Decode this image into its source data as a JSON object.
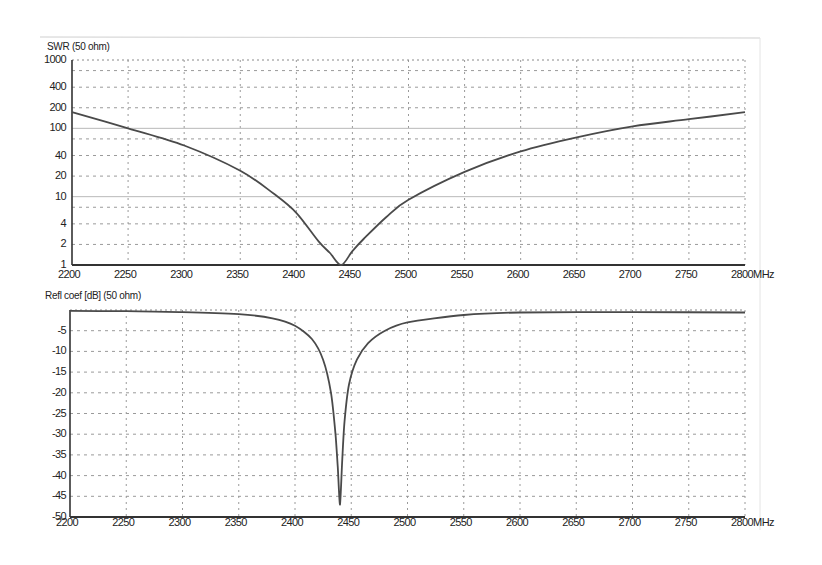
{
  "chart_data": [
    {
      "type": "line",
      "title": "SWR (50 ohm)",
      "xlabel": "MHz",
      "ylabel": "SWR",
      "yscale": "log",
      "xlim": [
        2200,
        2800
      ],
      "ylim": [
        1,
        1000
      ],
      "grid": true,
      "x_ticks": [
        "2200",
        "2250",
        "2300",
        "2350",
        "2400",
        "2450",
        "2500",
        "2550",
        "2600",
        "2650",
        "2700",
        "2750",
        "2800MHz"
      ],
      "y_ticks": [
        "1000",
        "400",
        "200",
        "100",
        "40",
        "20",
        "10",
        "4",
        "2",
        "1"
      ],
      "y_tick_values": [
        1000,
        400,
        200,
        100,
        40,
        20,
        10,
        4,
        2,
        1
      ],
      "series": [
        {
          "name": "SWR",
          "x": [
            2200,
            2250,
            2300,
            2350,
            2380,
            2400,
            2420,
            2430,
            2440,
            2450,
            2460,
            2480,
            2500,
            2550,
            2600,
            2650,
            2700,
            2750,
            2800
          ],
          "values": [
            172,
            100,
            56,
            24,
            11,
            5.8,
            2.2,
            1.5,
            1.0,
            1.6,
            2.4,
            5,
            9,
            23,
            46,
            74,
            107,
            136,
            172
          ]
        }
      ]
    },
    {
      "type": "line",
      "title": "Refl coef [dB] (50 ohm)",
      "xlabel": "MHz",
      "ylabel": "Reflection coefficient (dB)",
      "xlim": [
        2200,
        2800
      ],
      "ylim": [
        -50,
        0
      ],
      "grid": true,
      "x_ticks": [
        "2200",
        "2250",
        "2300",
        "2350",
        "2400",
        "2450",
        "2500",
        "2550",
        "2600",
        "2650",
        "2700",
        "2750",
        "2800MHz"
      ],
      "y_ticks": [
        "-5",
        "-10",
        "-15",
        "-20",
        "-25",
        "-30",
        "-35",
        "-40",
        "-45",
        "-50"
      ],
      "y_tick_values": [
        -5,
        -10,
        -15,
        -20,
        -25,
        -30,
        -35,
        -40,
        -45,
        -50
      ],
      "series": [
        {
          "name": "Refl coef",
          "x": [
            2200,
            2250,
            2300,
            2350,
            2380,
            2400,
            2415,
            2425,
            2432,
            2436,
            2438,
            2440,
            2442,
            2444,
            2448,
            2455,
            2465,
            2480,
            2500,
            2550,
            2600,
            2700,
            2800
          ],
          "values": [
            -0.2,
            -0.3,
            -0.5,
            -1.0,
            -2.0,
            -3.8,
            -7,
            -12,
            -20,
            -30,
            -38,
            -47,
            -36,
            -27,
            -18,
            -12,
            -8,
            -5,
            -3,
            -1.2,
            -0.6,
            -0.5,
            -0.6
          ]
        }
      ]
    }
  ]
}
